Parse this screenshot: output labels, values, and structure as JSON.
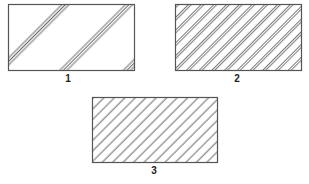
{
  "figure": {
    "colors": {
      "stroke": "#555555",
      "hatch": "#666666",
      "background": "#ffffff",
      "label": "#222222"
    },
    "panels": [
      {
        "id": "1",
        "label": "1",
        "pattern": "triple-line groups, widely spaced diagonal hatch",
        "rect": {
          "x": 8,
          "y": 4,
          "width": 126,
          "height": 66
        }
      },
      {
        "id": "2",
        "label": "2",
        "pattern": "double-line diagonal hatch, medium spacing",
        "rect": {
          "x": 175,
          "y": 4,
          "width": 126,
          "height": 66
        }
      },
      {
        "id": "3",
        "label": "3",
        "pattern": "single-line diagonal hatch, even spacing",
        "rect": {
          "x": 92,
          "y": 97,
          "width": 125,
          "height": 65
        }
      }
    ]
  }
}
